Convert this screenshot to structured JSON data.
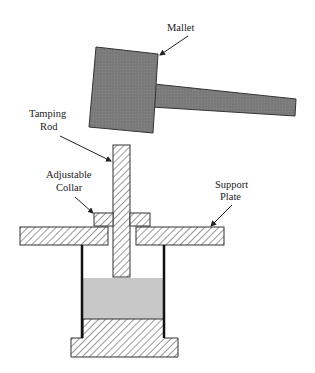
{
  "diagram": {
    "labels": {
      "mallet": "Mallet",
      "tamping_rod_line1": "Tamping",
      "tamping_rod_line2": "Rod",
      "adjustable_collar_line1": "Adjustable",
      "adjustable_collar_line2": "Collar",
      "support_plate_line1": "Support",
      "support_plate_line2": "Plate"
    },
    "components": [
      {
        "id": "mallet-head",
        "fill": "hatched-gray"
      },
      {
        "id": "mallet-handle",
        "fill": "hatched-gray"
      },
      {
        "id": "tamping-rod",
        "fill": "diagonal-hatch"
      },
      {
        "id": "adjustable-collar",
        "fill": "diagonal-hatch"
      },
      {
        "id": "support-plate",
        "fill": "diagonal-hatch"
      },
      {
        "id": "cylinder-walls",
        "fill": "black"
      },
      {
        "id": "sample",
        "fill": "light-gray"
      },
      {
        "id": "base",
        "fill": "diagonal-hatch"
      }
    ],
    "colors": {
      "mallet": "#7a7a7a",
      "sample": "#c8c8c8",
      "line": "#222222"
    }
  }
}
